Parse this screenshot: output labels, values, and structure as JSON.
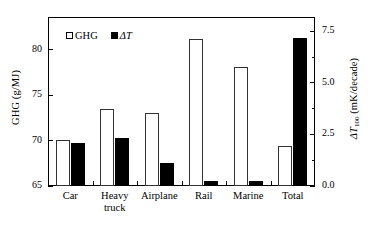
{
  "chart_data": {
    "type": "bar",
    "title": "",
    "categories": [
      "Car",
      "Heavy\ntruck",
      "Airplane",
      "Rail",
      "Marine",
      "Total"
    ],
    "series": [
      {
        "name": "GHG",
        "axis": "left",
        "marker": "open-square",
        "values": [
          70.1,
          73.5,
          73.0,
          81.2,
          78.1,
          69.4
        ]
      },
      {
        "name": "ΔT",
        "axis": "right",
        "marker": "filled-square",
        "values": [
          2.1,
          2.35,
          1.1,
          0.25,
          0.25,
          7.2
        ]
      }
    ],
    "xlabel": "",
    "ylabel": "GHG (g/MJ)",
    "ylabel_right": "ΔT100 (mK/decade)",
    "ylim": [
      65,
      83.6
    ],
    "ylim_right": [
      0.0,
      8.2
    ],
    "yticks": [
      65,
      70,
      75,
      80
    ],
    "yticks_right": [
      0.0,
      2.5,
      5.0,
      7.5
    ],
    "yticks_right_minor": [
      1.25,
      3.75,
      6.25
    ],
    "grid": false,
    "legend_position": "top-left"
  },
  "axes": {
    "left": {
      "label_main": "GHG (g/MJ)",
      "ticks": [
        {
          "value": 80,
          "label": "80"
        },
        {
          "value": 75,
          "label": "75"
        },
        {
          "value": 70,
          "label": "70"
        },
        {
          "value": 65,
          "label": "65"
        }
      ]
    },
    "right": {
      "label_symbol": "ΔT",
      "label_sub": "100",
      "label_unit": " (mK/decade)",
      "ticks": [
        {
          "value": 7.5,
          "label": "7.5"
        },
        {
          "value": 5.0,
          "label": "5.0"
        },
        {
          "value": 2.5,
          "label": "2.5"
        },
        {
          "value": 0.0,
          "label": "0.0"
        }
      ]
    }
  },
  "legend": {
    "items": [
      {
        "label": "GHG",
        "style": "open-square"
      },
      {
        "label": "ΔT",
        "style": "filled-square",
        "italic_part": "T"
      }
    ]
  }
}
